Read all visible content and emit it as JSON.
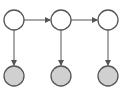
{
  "diagram": {
    "type": "hidden-markov-model",
    "colors": {
      "stroke": "#555555",
      "hidden_fill": "#ffffff",
      "observed_fill": "#d0d0d0",
      "background": "#ffffff"
    },
    "hidden_nodes": [
      {
        "id": "h1",
        "cx": 14,
        "cy": 20
      },
      {
        "id": "h2",
        "cx": 61,
        "cy": 20
      },
      {
        "id": "h3",
        "cx": 108,
        "cy": 20
      }
    ],
    "observed_nodes": [
      {
        "id": "o1",
        "cx": 14,
        "cy": 76
      },
      {
        "id": "o2",
        "cx": 61,
        "cy": 76
      },
      {
        "id": "o3",
        "cx": 108,
        "cy": 76
      }
    ],
    "radius": 10,
    "edges": [
      {
        "from": "h1",
        "to": "h2"
      },
      {
        "from": "h2",
        "to": "h3"
      },
      {
        "from": "h1",
        "to": "o1"
      },
      {
        "from": "h2",
        "to": "o2"
      },
      {
        "from": "h3",
        "to": "o3"
      }
    ]
  }
}
